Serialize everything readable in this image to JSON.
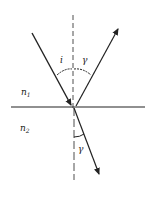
{
  "diagram": {
    "type": "refraction-reflection",
    "labels": {
      "incident_angle": "i",
      "reflected_angle": "γ",
      "refracted_angle": "γ",
      "medium1": "n",
      "medium1_sub": "1",
      "medium2": "n",
      "medium2_sub": "2"
    },
    "colors": {
      "line": "#222222",
      "background": "#ffffff"
    }
  }
}
